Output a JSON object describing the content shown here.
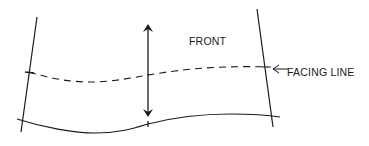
{
  "diagram": {
    "labels": {
      "front": "FRONT",
      "facing_line": "FACING LINE"
    },
    "elements": [
      {
        "name": "left-edge-line",
        "type": "solid-line"
      },
      {
        "name": "right-edge-line",
        "type": "solid-line"
      },
      {
        "name": "facing-line",
        "type": "dashed-curve"
      },
      {
        "name": "bottom-edge-curve",
        "type": "solid-curve"
      },
      {
        "name": "front-depth-arrow",
        "type": "double-headed-arrow"
      },
      {
        "name": "facing-line-pointer",
        "type": "arrow"
      }
    ],
    "colors": {
      "stroke": "#1a1a1a",
      "background": "#ffffff"
    }
  }
}
